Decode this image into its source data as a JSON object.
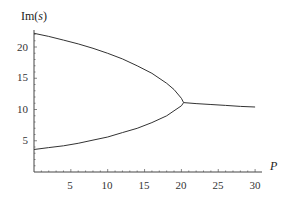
{
  "chart_data": {
    "type": "line",
    "title": "",
    "xlabel": "P",
    "ylabel": "Im(s)",
    "xlim": [
      0,
      31
    ],
    "ylim": [
      0,
      23
    ],
    "x_ticks": [
      5,
      10,
      15,
      20,
      25,
      30
    ],
    "y_ticks": [
      5,
      10,
      15,
      20
    ],
    "grid": false,
    "legend": null,
    "series": [
      {
        "name": "upper branch",
        "x": [
          0,
          2,
          4,
          6,
          8,
          10,
          12,
          14,
          16,
          18,
          19,
          20,
          20.3
        ],
        "y": [
          22.2,
          21.7,
          21.1,
          20.5,
          19.8,
          19.0,
          18.1,
          17.0,
          15.8,
          14.2,
          13.2,
          11.8,
          11.1
        ]
      },
      {
        "name": "lower branch",
        "x": [
          0,
          2,
          4,
          6,
          8,
          10,
          12,
          14,
          16,
          18,
          19,
          20,
          20.3
        ],
        "y": [
          3.6,
          3.9,
          4.2,
          4.6,
          5.1,
          5.6,
          6.3,
          7.0,
          7.9,
          9.0,
          9.8,
          10.6,
          11.1
        ]
      },
      {
        "name": "merged branch",
        "x": [
          20.3,
          22,
          24,
          26,
          28,
          30
        ],
        "y": [
          11.1,
          10.95,
          10.8,
          10.65,
          10.5,
          10.4
        ]
      }
    ]
  },
  "labels": {
    "ylabel_main": "Im(",
    "ylabel_var": "s",
    "ylabel_close": ")",
    "xlabel": "P",
    "xticks": [
      "5",
      "10",
      "15",
      "20",
      "25",
      "30"
    ],
    "yticks": [
      "5",
      "10",
      "15",
      "20"
    ]
  }
}
